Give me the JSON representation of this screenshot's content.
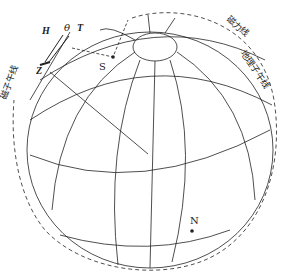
{
  "diagram": {
    "type": "geomagnetic-field-globe",
    "labels": {
      "H": "H",
      "theta": "θ",
      "T": "T",
      "Z": "Z",
      "S": "S",
      "N": "N",
      "magnetic_meridian": "磁子午线",
      "magnetic_field_line": "磁力线",
      "geographic_meridian": "地理子午线"
    },
    "colors": {
      "line": "#222222",
      "background": "#ffffff"
    }
  }
}
